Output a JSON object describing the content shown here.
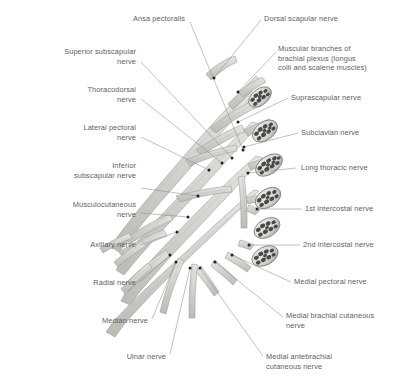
{
  "diagram": {
    "background_color": "#ffffff",
    "label_color": "#5d6063",
    "leader_line_color": "#8a8d90",
    "nerve_fill_color": "#d8d6d2",
    "nerve_outline_color": "#9a9893",
    "fascicle_color": "#3a3a3a",
    "marker_color": "#222222"
  },
  "labels_left": [
    {
      "id": "ansa-pectoralis",
      "text": "Ansa pectoralis",
      "x": 60,
      "y": 14,
      "width": 125,
      "align": "right",
      "leader": [
        [
          190,
          22
        ],
        [
          243,
          150
        ]
      ]
    },
    {
      "id": "superior-subscapular-nerve",
      "text": "Superior subscapular\nnerve",
      "x": 18,
      "y": 47,
      "width": 118,
      "align": "right",
      "leader": [
        [
          141,
          62
        ],
        [
          232,
          158
        ]
      ]
    },
    {
      "id": "thoracodorsal-nerve",
      "text": "Thoracodorsal\nnerve",
      "x": 30,
      "y": 85,
      "width": 106,
      "align": "right",
      "leader": [
        [
          141,
          99
        ],
        [
          222,
          163
        ]
      ]
    },
    {
      "id": "lateral-pectoral-nerve",
      "text": "Lateral pectoral\nnerve",
      "x": 25,
      "y": 123,
      "width": 111,
      "align": "right",
      "leader": [
        [
          141,
          137
        ],
        [
          209,
          170
        ]
      ]
    },
    {
      "id": "inferior-subscapular-nerve",
      "text": "Inferior\nsubscapular nerve",
      "x": 16,
      "y": 161,
      "width": 120,
      "align": "right",
      "leader": [
        [
          141,
          188
        ],
        [
          198,
          196
        ]
      ]
    },
    {
      "id": "musculocutaneous-nerve",
      "text": "Musculocutaneous\nnerve",
      "x": 14,
      "y": 200,
      "width": 122,
      "align": "right",
      "leader": [
        [
          140,
          213
        ],
        [
          188,
          217
        ]
      ]
    },
    {
      "id": "axillary-nerve",
      "text": "Axillary nerve",
      "x": 38,
      "y": 240,
      "width": 98,
      "align": "right",
      "leader": [
        [
          140,
          245
        ],
        [
          177,
          232
        ]
      ]
    },
    {
      "id": "radial-nerve",
      "text": "Radial nerve",
      "x": 44,
      "y": 278,
      "width": 92,
      "align": "right",
      "leader": [
        [
          140,
          282
        ],
        [
          170,
          255
        ]
      ]
    },
    {
      "id": "median-nerve",
      "text": "Median nerve",
      "x": 52,
      "y": 316,
      "width": 96,
      "align": "right",
      "leader": [
        [
          152,
          319
        ],
        [
          176,
          262
        ]
      ]
    },
    {
      "id": "ulnar-nerve",
      "text": "Ulnar nerve",
      "x": 78,
      "y": 352,
      "width": 88,
      "align": "right",
      "leader": [
        [
          170,
          354
        ],
        [
          190,
          268
        ]
      ]
    }
  ],
  "labels_right": [
    {
      "id": "dorsal-scapular-nerve",
      "text": "Dorsal scapular nerve",
      "x": 264,
      "y": 14,
      "width": 132,
      "align": "left",
      "leader": [
        [
          261,
          20
        ],
        [
          214,
          78
        ]
      ]
    },
    {
      "id": "muscular-branches",
      "text": "Muscular branches of\nbrachial plexus (longus\ncolli and scalene muscles)",
      "x": 278,
      "y": 44,
      "width": 120,
      "align": "left",
      "leader": [
        [
          276,
          52
        ],
        [
          238,
          92
        ]
      ]
    },
    {
      "id": "suprascapular-nerve",
      "text": "Suprascapular nerve",
      "x": 291,
      "y": 93,
      "width": 108,
      "align": "left",
      "leader": [
        [
          288,
          98
        ],
        [
          238,
          122
        ]
      ]
    },
    {
      "id": "subclavian-nerve",
      "text": "Subclavian nerve",
      "x": 301,
      "y": 128,
      "width": 98,
      "align": "left",
      "leader": [
        [
          298,
          133
        ],
        [
          244,
          147
        ]
      ]
    },
    {
      "id": "long-thoracic-nerve",
      "text": "Long thoracic nerve",
      "x": 301,
      "y": 163,
      "width": 98,
      "align": "left",
      "leader": [
        [
          296,
          168
        ],
        [
          248,
          173
        ]
      ]
    },
    {
      "id": "first-intercostal-nerve",
      "text": "1st intercostal nerve",
      "x": 305,
      "y": 204,
      "width": 94,
      "align": "left",
      "leader": [
        [
          302,
          209
        ],
        [
          257,
          209
        ]
      ]
    },
    {
      "id": "second-intercostal-nerve",
      "text": "2nd intercostal nerve",
      "x": 303,
      "y": 240,
      "width": 96,
      "align": "left",
      "leader": [
        [
          300,
          245
        ],
        [
          249,
          245
        ]
      ]
    },
    {
      "id": "medial-pectoral-nerve",
      "text": "Medial pectoral nerve",
      "x": 294,
      "y": 277,
      "width": 105,
      "align": "left",
      "leader": [
        [
          291,
          282
        ],
        [
          232,
          255
        ]
      ]
    },
    {
      "id": "medial-brachial-cutaneous-nerve",
      "text": "Medial brachial cutaneous\nnerve",
      "x": 286,
      "y": 311,
      "width": 113,
      "align": "left",
      "leader": [
        [
          283,
          317
        ],
        [
          215,
          262
        ]
      ]
    },
    {
      "id": "medial-antebrachial-cutaneous-nerve",
      "text": "Medial antebrachial\ncutaneous nerve",
      "x": 266,
      "y": 352,
      "width": 120,
      "align": "left",
      "leader": [
        [
          263,
          356
        ],
        [
          200,
          268
        ]
      ]
    }
  ],
  "nerve_cross_sections": [
    {
      "id": "root-c5",
      "cx": 260,
      "cy": 97,
      "rx": 13,
      "ry": 8,
      "rot": -38
    },
    {
      "id": "root-c6",
      "cx": 265,
      "cy": 131,
      "rx": 14,
      "ry": 9,
      "rot": -36
    },
    {
      "id": "root-c7",
      "cx": 269,
      "cy": 165,
      "rx": 15,
      "ry": 9,
      "rot": -34
    },
    {
      "id": "root-c8",
      "cx": 268,
      "cy": 198,
      "rx": 14,
      "ry": 9,
      "rot": -32
    },
    {
      "id": "root-t1",
      "cx": 267,
      "cy": 228,
      "rx": 14,
      "ry": 9,
      "rot": -30
    },
    {
      "id": "root-t2",
      "cx": 265,
      "cy": 256,
      "rx": 14,
      "ry": 9,
      "rot": -28
    }
  ]
}
